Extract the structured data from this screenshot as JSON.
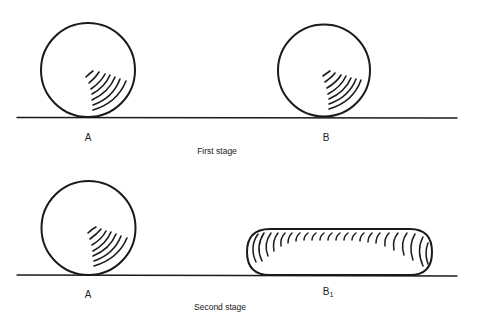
{
  "stages": [
    {
      "caption": "First stage",
      "objects": [
        {
          "label": "A",
          "shape": "sphere"
        },
        {
          "label": "B",
          "shape": "sphere"
        }
      ]
    },
    {
      "caption": "Second stage",
      "objects": [
        {
          "label": "A",
          "shape": "sphere"
        },
        {
          "label": "B",
          "subscript": "1",
          "shape": "flattened-cylinder"
        }
      ]
    }
  ],
  "colors": {
    "line": "#1a1a1a",
    "background": "#ffffff"
  }
}
